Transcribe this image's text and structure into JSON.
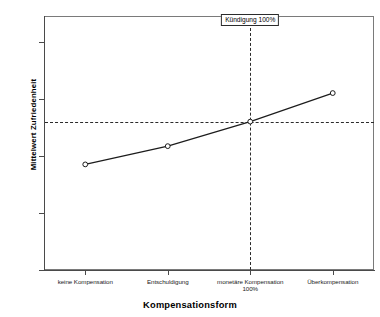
{
  "chart_data": {
    "type": "line",
    "title": "",
    "xlabel": "Kompensationsform",
    "ylabel": "Mittelwert Zufriedenheit",
    "categories": [
      "keine Kompensation",
      "Entschuldigung",
      "monetäre Kompensation\n100%",
      "Überkompensation"
    ],
    "category_labels": [
      {
        "line1": "keine Kompensation",
        "line2": ""
      },
      {
        "line1": "Entschuldigung",
        "line2": ""
      },
      {
        "line1": "monetäre Kompensation",
        "line2": "100%"
      },
      {
        "line1": "Überkompensation",
        "line2": ""
      }
    ],
    "values": [
      1.85,
      2.17,
      2.6,
      3.1
    ],
    "series": [
      {
        "name": "Mittelwert Zufriedenheit",
        "values": [
          1.85,
          2.17,
          2.6,
          3.1
        ]
      }
    ],
    "ylim": [
      0,
      4.45
    ],
    "ytick_labels": [
      "0,00",
      "1,00",
      "2,00",
      "3,00",
      "4,00"
    ],
    "ytick_values": [
      0,
      1,
      2,
      3,
      4
    ],
    "grid": false,
    "legend": "none",
    "marker": "open-circle",
    "reference_lines": [
      {
        "name": "horizontal-mean-line",
        "orientation": "horizontal",
        "value": 2.6,
        "style": "dashed"
      },
      {
        "name": "vertical-category-line",
        "orientation": "vertical",
        "category_index": 2,
        "style": "dashed"
      }
    ],
    "annotations": [
      {
        "name": "kuendigung-annotation",
        "text": "Kündigung 100%",
        "category_index": 2,
        "boxed": true
      }
    ],
    "colors": {
      "line": "#1c1c1c",
      "marker_fill": "#ffffff",
      "marker_stroke": "#1c1c1c",
      "reference": "#2b2b2b",
      "frame": "#7a7a7a",
      "background": "#ffffff",
      "text": "#000000"
    }
  }
}
